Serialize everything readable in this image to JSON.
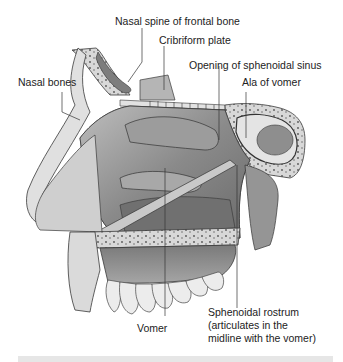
{
  "figure": {
    "labels": [
      {
        "id": "nasal-spine",
        "text": "Nasal spine of frontal bone"
      },
      {
        "id": "cribriform",
        "text": "Cribriform plate"
      },
      {
        "id": "sphenoid-opening",
        "text": "Opening of sphenoidal sinus"
      },
      {
        "id": "nasal-bones",
        "text": "Nasal bones"
      },
      {
        "id": "ala-vomer",
        "text": "Ala of vomer"
      },
      {
        "id": "vomer",
        "text": "Vomer"
      },
      {
        "id": "rostrum-1",
        "text": "Sphenoidal rostrum"
      },
      {
        "id": "rostrum-2",
        "text": "(articulates in the"
      },
      {
        "id": "rostrum-3",
        "text": "midline with the vomer)"
      }
    ]
  },
  "colors": {
    "bone_light": "#d9d9d9",
    "bone_mid": "#a8a8a8",
    "bone_dark": "#6e6e6e",
    "outline": "#3a3a3a",
    "leader": "#333333",
    "bar": "#e6e6e6"
  }
}
